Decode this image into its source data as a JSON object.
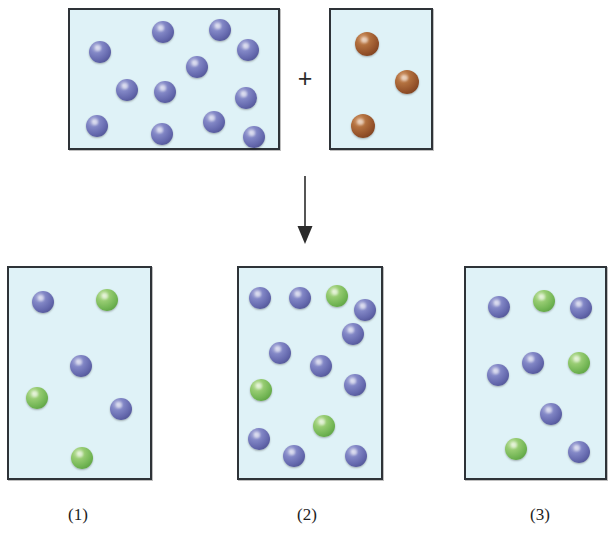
{
  "diagram": {
    "symbols": {
      "plus": "+",
      "arrow": "down-arrow"
    },
    "colors": {
      "blue_sphere": "#6468ad",
      "green_sphere": "#72b554",
      "brown_sphere": "#94522a",
      "box_fill": "#dff2f7",
      "box_border": "#2e3338",
      "background": "#ffffff",
      "text": "#1d1d1d"
    },
    "reactants": [
      {
        "name": "reactant-box-blue",
        "frame": {
          "x": 68,
          "y": 8,
          "w": 212,
          "h": 142
        },
        "counts": {
          "blue": 12,
          "green": 0,
          "brown": 0
        },
        "spheres": [
          {
            "color": "blue",
            "cx": 30,
            "cy": 42,
            "r": 11
          },
          {
            "color": "blue",
            "cx": 93,
            "cy": 22,
            "r": 11
          },
          {
            "color": "blue",
            "cx": 150,
            "cy": 20,
            "r": 11
          },
          {
            "color": "blue",
            "cx": 178,
            "cy": 40,
            "r": 11
          },
          {
            "color": "blue",
            "cx": 127,
            "cy": 57,
            "r": 11
          },
          {
            "color": "blue",
            "cx": 57,
            "cy": 80,
            "r": 11
          },
          {
            "color": "blue",
            "cx": 95,
            "cy": 82,
            "r": 11
          },
          {
            "color": "blue",
            "cx": 176,
            "cy": 88,
            "r": 11
          },
          {
            "color": "blue",
            "cx": 27,
            "cy": 116,
            "r": 11
          },
          {
            "color": "blue",
            "cx": 92,
            "cy": 124,
            "r": 11
          },
          {
            "color": "blue",
            "cx": 144,
            "cy": 112,
            "r": 11
          },
          {
            "color": "blue",
            "cx": 184,
            "cy": 127,
            "r": 11
          }
        ]
      },
      {
        "name": "reactant-box-brown",
        "frame": {
          "x": 329,
          "y": 8,
          "w": 104,
          "h": 142
        },
        "counts": {
          "blue": 0,
          "green": 0,
          "brown": 3
        },
        "spheres": [
          {
            "color": "brown",
            "cx": 36,
            "cy": 34,
            "r": 12
          },
          {
            "color": "brown",
            "cx": 76,
            "cy": 72,
            "r": 12
          },
          {
            "color": "brown",
            "cx": 32,
            "cy": 116,
            "r": 12
          }
        ]
      }
    ],
    "products": [
      {
        "name": "product-box-1",
        "label": "(1)",
        "label_x": 78,
        "label_y": 505,
        "frame": {
          "x": 7,
          "y": 266,
          "w": 145,
          "h": 214
        },
        "counts": {
          "blue": 3,
          "green": 3,
          "brown": 0
        },
        "spheres": [
          {
            "color": "blue",
            "cx": 34,
            "cy": 34,
            "r": 11
          },
          {
            "color": "green",
            "cx": 98,
            "cy": 32,
            "r": 11
          },
          {
            "color": "blue",
            "cx": 72,
            "cy": 98,
            "r": 11
          },
          {
            "color": "green",
            "cx": 28,
            "cy": 130,
            "r": 11
          },
          {
            "color": "blue",
            "cx": 112,
            "cy": 141,
            "r": 11
          },
          {
            "color": "green",
            "cx": 73,
            "cy": 190,
            "r": 11
          }
        ]
      },
      {
        "name": "product-box-2",
        "label": "(2)",
        "label_x": 307,
        "label_y": 505,
        "frame": {
          "x": 237,
          "y": 266,
          "w": 146,
          "h": 214
        },
        "counts": {
          "blue": 10,
          "green": 3,
          "brown": 0
        },
        "spheres": [
          {
            "color": "blue",
            "cx": 21,
            "cy": 30,
            "r": 11
          },
          {
            "color": "blue",
            "cx": 61,
            "cy": 30,
            "r": 11
          },
          {
            "color": "green",
            "cx": 98,
            "cy": 28,
            "r": 11
          },
          {
            "color": "blue",
            "cx": 114,
            "cy": 66,
            "r": 11
          },
          {
            "color": "blue",
            "cx": 41,
            "cy": 85,
            "r": 11
          },
          {
            "color": "blue",
            "cx": 82,
            "cy": 98,
            "r": 11
          },
          {
            "color": "blue",
            "cx": 116,
            "cy": 117,
            "r": 11
          },
          {
            "color": "green",
            "cx": 22,
            "cy": 122,
            "r": 11
          },
          {
            "color": "green",
            "cx": 85,
            "cy": 158,
            "r": 11
          },
          {
            "color": "blue",
            "cx": 20,
            "cy": 171,
            "r": 11
          },
          {
            "color": "blue",
            "cx": 55,
            "cy": 188,
            "r": 11
          },
          {
            "color": "blue",
            "cx": 117,
            "cy": 188,
            "r": 11
          },
          {
            "color": "blue",
            "cx": 126,
            "cy": 42,
            "r": 11
          }
        ]
      },
      {
        "name": "product-box-3",
        "label": "(3)",
        "label_x": 540,
        "label_y": 505,
        "frame": {
          "x": 464,
          "y": 266,
          "w": 143,
          "h": 214
        },
        "counts": {
          "blue": 7,
          "green": 3,
          "brown": 0
        },
        "spheres": [
          {
            "color": "blue",
            "cx": 33,
            "cy": 39,
            "r": 11
          },
          {
            "color": "green",
            "cx": 78,
            "cy": 33,
            "r": 11
          },
          {
            "color": "blue",
            "cx": 115,
            "cy": 40,
            "r": 11
          },
          {
            "color": "blue",
            "cx": 67,
            "cy": 95,
            "r": 11
          },
          {
            "color": "green",
            "cx": 113,
            "cy": 95,
            "r": 11
          },
          {
            "color": "blue",
            "cx": 32,
            "cy": 107,
            "r": 11
          },
          {
            "color": "blue",
            "cx": 85,
            "cy": 146,
            "r": 11
          },
          {
            "color": "green",
            "cx": 50,
            "cy": 181,
            "r": 11
          },
          {
            "color": "blue",
            "cx": 113,
            "cy": 184,
            "r": 11
          }
        ]
      }
    ]
  }
}
